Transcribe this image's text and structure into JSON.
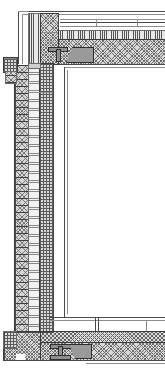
{
  "drawing": {
    "title": "Wall / Roof / Floor Junction Section",
    "discipline": "architectural-detail",
    "view": "vertical-cross-section",
    "scale_note": "",
    "width_px": 165,
    "height_px": 371,
    "background_color": "#ffffff",
    "line_color": "#3a3a3a",
    "labels": []
  },
  "palette": {
    "paper": "#ffffff",
    "ink": "#3a3a3a",
    "ink_light": "#8d8d8d",
    "fill_concrete": "#d9d9d9",
    "fill_slab": "#dcdcdc",
    "fill_insulation": "#e8e8e8",
    "fill_masonry": "#d5d5d5",
    "fill_steel": "#8f8f8f",
    "void": "#ffffff"
  },
  "assemblies": {
    "roof": {
      "name": "roof-assembly",
      "components": [
        {
          "id": "roof-membrane-line-1",
          "type": "line",
          "style": "solid"
        },
        {
          "id": "roof-membrane-line-2",
          "type": "line",
          "style": "solid"
        },
        {
          "id": "roof-membrane-line-3",
          "type": "line",
          "style": "solid"
        },
        {
          "id": "roof-vapour-barrier",
          "type": "line",
          "style": "dashed"
        },
        {
          "id": "roof-insulation",
          "type": "hatch",
          "pattern": "vertical-lines"
        },
        {
          "id": "roof-structural-slab",
          "type": "hatch",
          "pattern": "cross-hatch"
        }
      ]
    },
    "parapet": {
      "name": "parapet-upstand",
      "components": [
        {
          "id": "parapet-coping-line",
          "type": "line",
          "style": "solid"
        },
        {
          "id": "parapet-outer-face",
          "type": "hatch",
          "pattern": "vertical-lines"
        },
        {
          "id": "parapet-core",
          "type": "hatch",
          "pattern": "cross-hatch"
        }
      ]
    },
    "wall": {
      "name": "external-wall-buildup",
      "leaves": [
        {
          "id": "wall-outer-masonry-leaf",
          "pattern": "brick-coursing"
        },
        {
          "id": "wall-cavity-insulation",
          "pattern": "horizontal-lines"
        },
        {
          "id": "wall-inner-leaf",
          "pattern": "grid-checker"
        }
      ]
    },
    "floor": {
      "name": "floor-assembly",
      "components": [
        {
          "id": "floor-finish-line-1",
          "type": "line",
          "style": "solid"
        },
        {
          "id": "floor-finish-line-2",
          "type": "line",
          "style": "solid"
        },
        {
          "id": "floor-screed",
          "type": "hatch",
          "pattern": "cross-hatch"
        },
        {
          "id": "floor-structural-slab",
          "type": "hatch",
          "pattern": "cross-hatch"
        },
        {
          "id": "floor-soffit-line",
          "type": "line",
          "style": "solid"
        }
      ]
    },
    "steelwork": {
      "name": "structural-steel",
      "members": [
        {
          "id": "upper-tee-section",
          "profile": "T",
          "position": "head-of-opening"
        },
        {
          "id": "lower-tee-section",
          "profile": "T",
          "position": "floor-level"
        },
        {
          "id": "upper-cleat-plate",
          "profile": "plate"
        },
        {
          "id": "lower-cleat-plate",
          "profile": "plate"
        }
      ]
    },
    "opening": {
      "name": "glazed-opening-void",
      "fill": "void-white",
      "jamb_line": "vertical-solid"
    },
    "foundation": {
      "name": "base-support",
      "components": [
        {
          "id": "base-bearing-pad",
          "pattern": "grid-checker"
        },
        {
          "id": "base-plinth",
          "pattern": "cross-hatch"
        }
      ]
    }
  }
}
